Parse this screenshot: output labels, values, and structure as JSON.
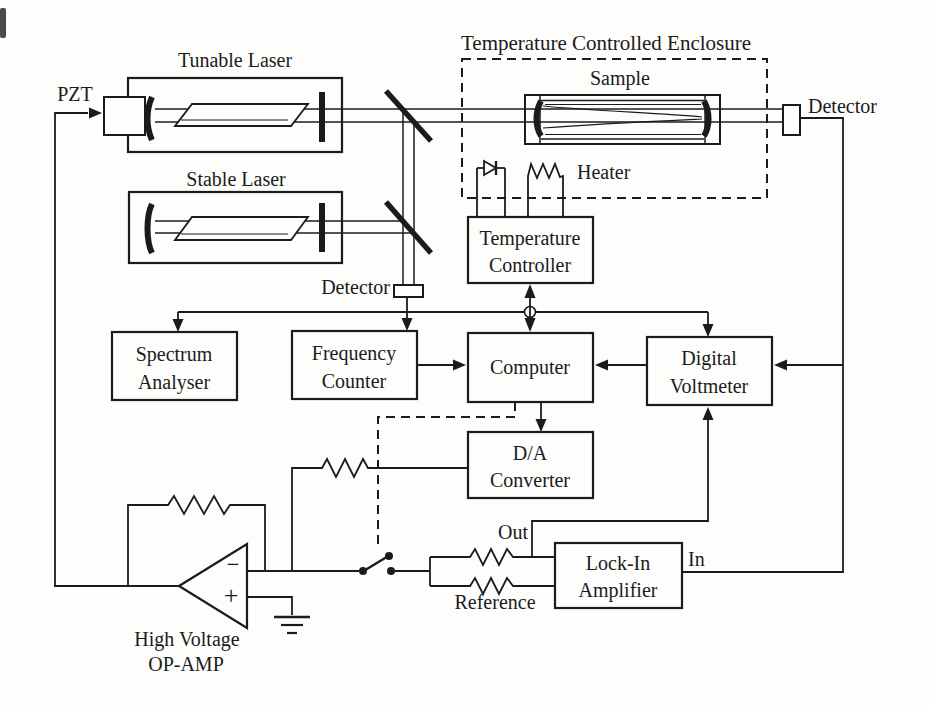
{
  "figure": {
    "enclosure_title": "Temperature Controlled Enclosure",
    "labels": {
      "pzt": "PZT",
      "tunable_laser": "Tunable Laser",
      "stable_laser": "Stable Laser",
      "sample": "Sample",
      "heater": "Heater",
      "detector_top": "Detector",
      "detector_mid": "Detector",
      "out_port": "Out",
      "in_port": "In",
      "reference_port": "Reference",
      "high_voltage": "High Voltage",
      "op_amp": "OP-AMP",
      "minus": "−",
      "plus": "+"
    },
    "boxes": {
      "spectrum_analyser": [
        "Spectrum",
        "Analyser"
      ],
      "frequency_counter": [
        "Frequency",
        "Counter"
      ],
      "computer": [
        "Computer"
      ],
      "temperature_controller": [
        "Temperature",
        "Controller"
      ],
      "digital_voltmeter": [
        "Digital",
        "Voltmeter"
      ],
      "da_converter": [
        "D/A",
        "Converter"
      ],
      "lock_in_amplifier": [
        "Lock-In",
        "Amplifier"
      ]
    },
    "colors": {
      "ink": "#1b1b1b",
      "paper": "#fdfdfb"
    }
  }
}
